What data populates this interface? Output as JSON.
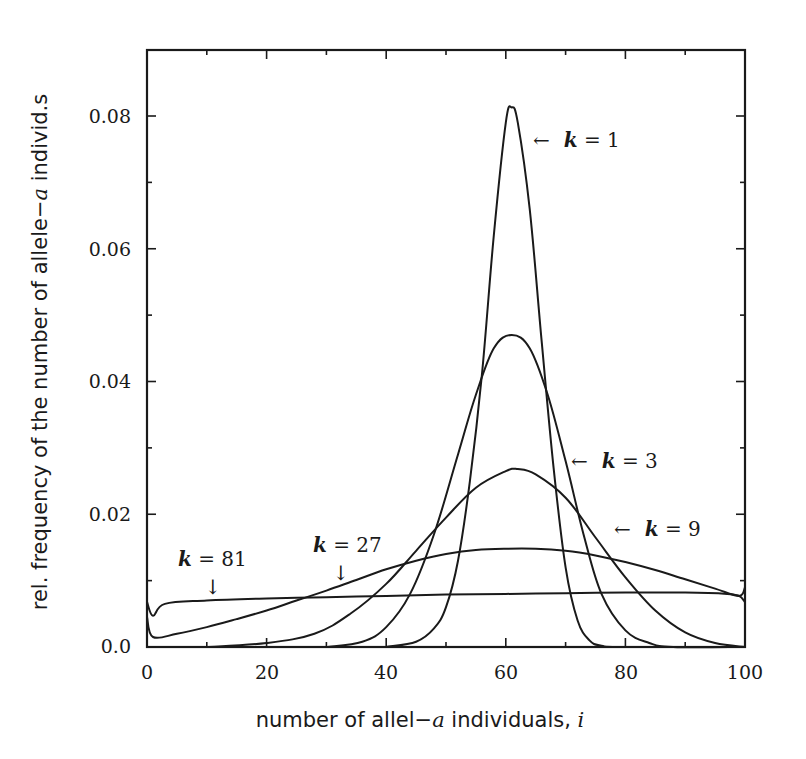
{
  "chart_data": {
    "type": "line",
    "title": "",
    "xlabel": "number of allel−a individuals, i",
    "ylabel": "rel. frequency of the number of allele−a individ.s",
    "xlim": [
      0,
      100
    ],
    "ylim": [
      0,
      0.09
    ],
    "grid": false,
    "legend": "inline annotations",
    "x_ticks": [
      0,
      20,
      40,
      60,
      80,
      100
    ],
    "x_minor_ticks": [
      10,
      30,
      50,
      70,
      90
    ],
    "y_ticks": [
      0.0,
      0.02,
      0.04,
      0.06,
      0.08
    ],
    "y_minor_ticks": [
      0.01,
      0.03,
      0.05,
      0.07
    ],
    "x_tick_labels": [
      "0",
      "20",
      "40",
      "60",
      "80",
      "100"
    ],
    "y_tick_labels": [
      "0.0",
      "0.02",
      "0.04",
      "0.06",
      "0.08"
    ],
    "series": [
      {
        "name": "k = 1",
        "x": [
          40,
          45,
          48,
          50,
          52,
          54,
          56,
          58,
          60,
          61,
          62,
          64,
          66,
          68,
          70,
          72,
          74,
          76,
          80,
          100
        ],
        "values": [
          0.0,
          0.0008,
          0.0028,
          0.006,
          0.013,
          0.025,
          0.041,
          0.062,
          0.079,
          0.0813,
          0.079,
          0.066,
          0.046,
          0.027,
          0.012,
          0.004,
          0.001,
          0.0002,
          0.0,
          0.0
        ]
      },
      {
        "name": "k = 3",
        "x": [
          30,
          36,
          40,
          44,
          48,
          52,
          55,
          58,
          61,
          64,
          67,
          70,
          73,
          76,
          80,
          84,
          88,
          100
        ],
        "values": [
          0.0,
          0.0008,
          0.003,
          0.008,
          0.017,
          0.029,
          0.038,
          0.045,
          0.047,
          0.045,
          0.038,
          0.028,
          0.017,
          0.008,
          0.0025,
          0.0006,
          0.0,
          0.0
        ]
      },
      {
        "name": "k = 9",
        "x": [
          10,
          20,
          28,
          34,
          40,
          45,
          50,
          55,
          60,
          62,
          65,
          70,
          75,
          80,
          85,
          90,
          95,
          100
        ],
        "values": [
          0.0,
          0.0006,
          0.002,
          0.005,
          0.0095,
          0.0145,
          0.0195,
          0.024,
          0.0265,
          0.0268,
          0.026,
          0.0225,
          0.0165,
          0.0105,
          0.0055,
          0.0022,
          0.0006,
          0.0
        ]
      },
      {
        "name": "k = 27",
        "x": [
          0,
          1,
          5,
          10,
          15,
          20,
          25,
          30,
          35,
          40,
          45,
          50,
          55,
          60,
          65,
          70,
          75,
          80,
          85,
          90,
          95,
          99,
          100
        ],
        "values": [
          0.0045,
          0.0015,
          0.002,
          0.003,
          0.0042,
          0.0055,
          0.007,
          0.0085,
          0.0101,
          0.0117,
          0.013,
          0.014,
          0.0146,
          0.0148,
          0.0148,
          0.0145,
          0.0138,
          0.0128,
          0.0116,
          0.0102,
          0.0088,
          0.0077,
          0.009
        ]
      },
      {
        "name": "k = 81",
        "x": [
          0,
          1,
          3,
          10,
          20,
          30,
          40,
          50,
          60,
          70,
          80,
          90,
          97,
          99,
          100
        ],
        "values": [
          0.0068,
          0.0047,
          0.0065,
          0.007,
          0.0073,
          0.0075,
          0.0077,
          0.0079,
          0.008,
          0.0081,
          0.0082,
          0.0082,
          0.008,
          0.0077,
          0.0068
        ]
      }
    ],
    "annotations": [
      {
        "text_k": "k",
        "text_rest": " = 1",
        "arrow": "←",
        "position": "right of peak"
      },
      {
        "text_k": "k",
        "text_rest": " = 3",
        "arrow": "←",
        "position": "right side"
      },
      {
        "text_k": "k",
        "text_rest": " = 9",
        "arrow": "←",
        "position": "right side"
      },
      {
        "text_k": "k",
        "text_rest": " = 27",
        "arrow": "↓",
        "position": "above left flank"
      },
      {
        "text_k": "k",
        "text_rest": " = 81",
        "arrow": "↓",
        "position": "above flat curve"
      }
    ]
  },
  "labels": {
    "xlabel_main": "number of allel−",
    "xlabel_a": "a",
    "xlabel_tail": " individuals, ",
    "xlabel_i": "i",
    "ylabel_main": "rel. frequency of the number of allele−",
    "ylabel_a": "a",
    "ylabel_tail": " individ.s"
  }
}
